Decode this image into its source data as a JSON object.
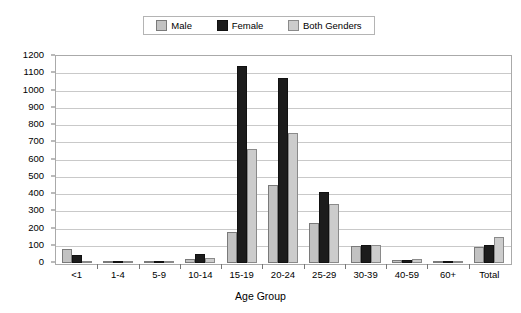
{
  "chart_data": {
    "type": "bar",
    "title": "",
    "xlabel": "Age Group",
    "ylabel": "",
    "ylim": [
      0,
      1200
    ],
    "ytick_step": 100,
    "grid": true,
    "legend_position": "top-center",
    "categories": [
      "<1",
      "1-4",
      "5-9",
      "10-14",
      "15-19",
      "20-24",
      "25-29",
      "30-39",
      "40-59",
      "60+",
      "Total"
    ],
    "yticks": [
      "0",
      "100",
      "200",
      "300",
      "400",
      "500",
      "600",
      "700",
      "800",
      "900",
      "1000",
      "1100",
      "1200"
    ],
    "series": [
      {
        "name": "Male",
        "color": "#c2c2c2",
        "values": [
          80,
          4,
          2,
          22,
          180,
          455,
          230,
          100,
          20,
          2,
          95
        ]
      },
      {
        "name": "Female",
        "color": "#1c1c1c",
        "values": [
          45,
          3,
          1,
          50,
          1140,
          1075,
          410,
          105,
          18,
          1,
          105
        ]
      },
      {
        "name": "Both Genders",
        "color": "#cccccc",
        "values": [
          8,
          2,
          1,
          28,
          660,
          755,
          340,
          105,
          22,
          1,
          150
        ]
      }
    ]
  },
  "legend": {
    "entries": [
      {
        "label": "Male",
        "swatch": "legend-swatch-male"
      },
      {
        "label": "Female",
        "swatch": "legend-swatch-female"
      },
      {
        "label": "Both Genders",
        "swatch": "legend-swatch-both"
      }
    ]
  },
  "colors": {
    "male": "#c2c2c2",
    "female": "#1c1c1c",
    "both": "#cccccc",
    "gridline": "#c9c9c9",
    "frame": "#aaaaaa",
    "background": "#ffffff"
  }
}
